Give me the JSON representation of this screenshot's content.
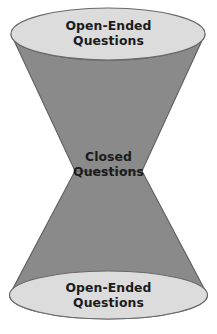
{
  "diagram": {
    "type": "hourglass-funnel",
    "colors": {
      "body_fill": "#8a8a8a",
      "ellipse_fill": "#dcdcdc",
      "outline": "#5e5e5e",
      "text": "#1b1b1b",
      "background": "#ffffff"
    },
    "sections": [
      {
        "id": "top",
        "position": "top",
        "label_lines": [
          "Open-Ended",
          "Questions"
        ],
        "fill": "#dcdcdc",
        "shape": "ellipse"
      },
      {
        "id": "middle",
        "position": "middle",
        "label_lines": [
          "Closed",
          "Questions"
        ],
        "fill": "#8a8a8a",
        "shape": "waist"
      },
      {
        "id": "bottom",
        "position": "bottom",
        "label_lines": [
          "Open-Ended",
          "Questions"
        ],
        "fill": "#dcdcdc",
        "shape": "ellipse"
      }
    ]
  }
}
